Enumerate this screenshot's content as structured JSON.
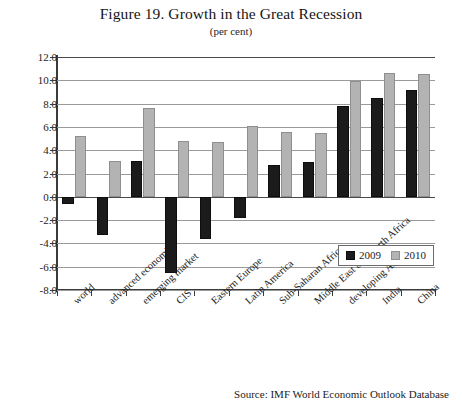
{
  "figure": {
    "title": "Figure 19. Growth in the Great Recession",
    "subtitle": "(per cent)",
    "source": "Source: IMF World Economic Outlook Database"
  },
  "legend": {
    "items": [
      {
        "label": "2009",
        "color": "#1b1b1b"
      },
      {
        "label": "2010",
        "color": "#b3b3b3"
      }
    ]
  },
  "chart_data": {
    "type": "bar",
    "title": "Figure 19. Growth in the Great Recession",
    "subtitle": "(per cent)",
    "xlabel": "",
    "ylabel": "",
    "ylim": [
      -8.0,
      12.0
    ],
    "ytick_step": 2.0,
    "ytick_labels": [
      "12.0",
      "10.0",
      "8.0",
      "6.0",
      "4.0",
      "2.0",
      "0.0",
      "-2.0",
      "-4.0",
      "-6.0",
      "-8.0"
    ],
    "ytick_values": [
      12.0,
      10.0,
      8.0,
      6.0,
      4.0,
      2.0,
      0.0,
      -2.0,
      -4.0,
      -6.0,
      -8.0
    ],
    "grid": true,
    "legend_position": "inside-bottom-right",
    "categories": [
      "world",
      "advanced economies",
      "emerging market",
      "CIS",
      "Eastern Europe",
      "Latin America",
      "Sub-Saharan Africa",
      "Middle East and North Africa",
      "developing Asia",
      "India",
      "China"
    ],
    "series": [
      {
        "name": "2009",
        "color": "#1b1b1b",
        "values": [
          -0.6,
          -3.3,
          3.1,
          -6.5,
          -3.6,
          -1.8,
          2.7,
          3.0,
          7.8,
          8.5,
          9.2
        ]
      },
      {
        "name": "2010",
        "color": "#b3b3b3",
        "values": [
          5.2,
          3.1,
          7.6,
          4.8,
          4.7,
          6.1,
          5.6,
          5.5,
          9.9,
          10.6,
          10.5
        ]
      }
    ]
  }
}
